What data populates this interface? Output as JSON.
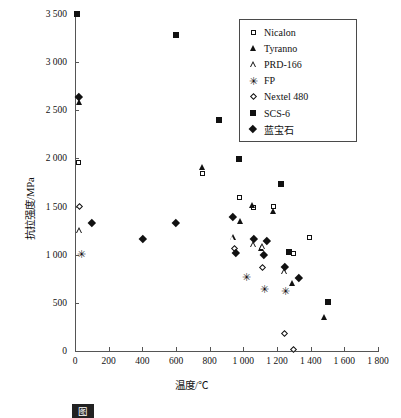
{
  "chart_data": {
    "type": "scatter",
    "title": "",
    "xlabel": "温度/℃",
    "ylabel": "抗拉强度/MPa",
    "xlim": [
      0,
      1800
    ],
    "ylim": [
      0,
      3500
    ],
    "xticks": [
      "0",
      "200",
      "400",
      "600",
      "800",
      "1 000",
      "1 200",
      "1 400",
      "1 600",
      "1 800"
    ],
    "xtick_values": [
      0,
      200,
      400,
      600,
      800,
      1000,
      1200,
      1400,
      1600,
      1800
    ],
    "yticks": [
      "0",
      "500",
      "1 000",
      "1 500",
      "2 000",
      "2 500",
      "3 000",
      "3 500"
    ],
    "ytick_values": [
      0,
      500,
      1000,
      1500,
      2000,
      2500,
      3000,
      3500
    ],
    "grid": false,
    "legend_position": "top-right",
    "series": [
      {
        "name": "Nicalon",
        "marker": "open-square",
        "points": [
          [
            20,
            1960
          ],
          [
            760,
            1840
          ],
          [
            975,
            1590
          ],
          [
            1060,
            1490
          ],
          [
            1180,
            1500
          ],
          [
            1300,
            1010
          ],
          [
            1395,
            1180
          ]
        ]
      },
      {
        "name": "Tyranno",
        "marker": "filled-triangle",
        "points": [
          [
            25,
            2580
          ],
          [
            760,
            1910
          ],
          [
            985,
            1350
          ],
          [
            1055,
            1510
          ],
          [
            1180,
            1450
          ],
          [
            1110,
            1070
          ],
          [
            1290,
            700
          ],
          [
            1480,
            350
          ]
        ]
      },
      {
        "name": "PRD-166",
        "marker": "open-triangle",
        "points": [
          [
            30,
            1250
          ],
          [
            940,
            1180
          ],
          [
            1060,
            1110
          ],
          [
            1115,
            1090
          ],
          [
            1245,
            830
          ]
        ]
      },
      {
        "name": "FP",
        "marker": "asterisk",
        "points": [
          [
            30,
            1000
          ],
          [
            1010,
            760
          ],
          [
            1120,
            640
          ],
          [
            1245,
            620
          ]
        ]
      },
      {
        "name": "Nextel 480",
        "marker": "open-diamond",
        "points": [
          [
            25,
            1500
          ],
          [
            945,
            1060
          ],
          [
            1115,
            870
          ],
          [
            1245,
            180
          ],
          [
            1300,
            20
          ]
        ]
      },
      {
        "name": "SCS-6",
        "marker": "filled-square",
        "points": [
          [
            10,
            3500
          ],
          [
            600,
            3280
          ],
          [
            855,
            2400
          ],
          [
            975,
            1990
          ],
          [
            1225,
            1730
          ],
          [
            1270,
            1030
          ],
          [
            1500,
            510
          ]
        ]
      },
      {
        "name": "蓝宝石",
        "marker": "filled-diamond",
        "points": [
          [
            25,
            2640
          ],
          [
            100,
            1330
          ],
          [
            400,
            1170
          ],
          [
            600,
            1330
          ],
          [
            940,
            1390
          ],
          [
            955,
            1020
          ],
          [
            1060,
            1170
          ],
          [
            1140,
            1150
          ],
          [
            1245,
            880
          ],
          [
            1330,
            760
          ],
          [
            1120,
            1000
          ]
        ]
      }
    ]
  },
  "legend": {
    "items": [
      {
        "label": "Nicalon",
        "marker": "open-square"
      },
      {
        "label": "Tyranno",
        "marker": "filled-triangle"
      },
      {
        "label": "PRD-166",
        "marker": "open-triangle"
      },
      {
        "label": "FP",
        "marker": "asterisk"
      },
      {
        "label": "Nextel 480",
        "marker": "open-diamond"
      },
      {
        "label": "SCS-6",
        "marker": "filled-square"
      },
      {
        "label": "蓝宝石",
        "marker": "filled-diamond"
      }
    ]
  },
  "caption": {
    "number": "图",
    "text": ""
  }
}
